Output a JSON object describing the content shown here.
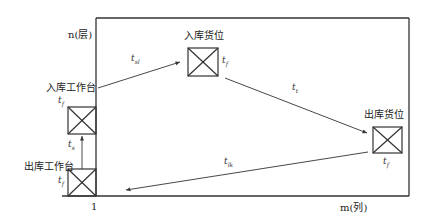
{
  "diagram": {
    "axes": {
      "y_label": "n(层)",
      "x_label": "m(列)",
      "origin_tick": "1"
    },
    "nodes": [
      {
        "id": "inbound-station",
        "label": "入库工作台",
        "time": "t",
        "time_sub": "f"
      },
      {
        "id": "outbound-station",
        "label": "出库工作台",
        "time": "t",
        "time_sub": "f"
      },
      {
        "id": "inbound-slot",
        "label": "入库货位",
        "time": "t",
        "time_sub": "f"
      },
      {
        "id": "outbound-slot",
        "label": "出库货位",
        "time": "t",
        "time_sub": "f"
      }
    ],
    "edges": [
      {
        "from": "outbound-station",
        "to": "inbound-station",
        "label": "t",
        "label_sub": "s"
      },
      {
        "from": "inbound-station",
        "to": "inbound-slot",
        "label": "t",
        "label_sub": "sl"
      },
      {
        "from": "inbound-slot",
        "to": "outbound-slot",
        "label": "t",
        "label_sub": "t"
      },
      {
        "from": "outbound-slot",
        "to": "outbound-station",
        "label": "t",
        "label_sub": "lk"
      }
    ],
    "colors": {
      "line": "#333333",
      "background": "#ffffff"
    }
  }
}
